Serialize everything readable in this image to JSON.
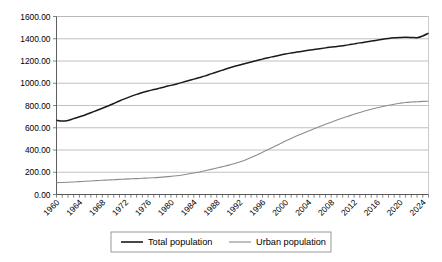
{
  "chart_data": {
    "type": "line",
    "title": "",
    "subtitle": "",
    "xlabel": "",
    "ylabel": "",
    "grid": true,
    "legend_position": "bottom",
    "ylim": [
      0,
      1600
    ],
    "ytick_step": 200,
    "ytick_labels": [
      "0.00",
      "200.00",
      "400.00",
      "600.00",
      "800.00",
      "1000.00",
      "1200.00",
      "1400.00",
      "1600.00"
    ],
    "ytick_values": [
      0,
      200,
      400,
      600,
      800,
      1000,
      1200,
      1400,
      1600
    ],
    "xlim": [
      1960,
      2025
    ],
    "xtick_step": 4,
    "xtick_labels": [
      "1960",
      "1964",
      "1968",
      "1972",
      "1976",
      "1980",
      "1984",
      "1988",
      "1992",
      "1996",
      "2000",
      "2004",
      "2008",
      "2012",
      "2016",
      "2020",
      "2024"
    ],
    "xtick_values": [
      1960,
      1964,
      1968,
      1972,
      1976,
      1980,
      1984,
      1988,
      1992,
      1996,
      2000,
      2004,
      2008,
      2012,
      2016,
      2020,
      2024
    ],
    "x": [
      1960,
      1961,
      1962,
      1963,
      1964,
      1965,
      1966,
      1967,
      1968,
      1969,
      1970,
      1971,
      1972,
      1973,
      1974,
      1975,
      1976,
      1977,
      1978,
      1979,
      1980,
      1981,
      1982,
      1983,
      1984,
      1985,
      1986,
      1987,
      1988,
      1989,
      1990,
      1991,
      1992,
      1993,
      1994,
      1995,
      1996,
      1997,
      1998,
      1999,
      2000,
      2001,
      2002,
      2003,
      2004,
      2005,
      2006,
      2007,
      2008,
      2009,
      2010,
      2011,
      2012,
      2013,
      2014,
      2015,
      2016,
      2017,
      2018,
      2019,
      2020,
      2021,
      2022,
      2023,
      2024,
      2025
    ],
    "series": [
      {
        "name": "Total population",
        "color": "#1a1a1a",
        "values": [
          667,
          660,
          666,
          682,
          699,
          715,
          735,
          755,
          775,
          796,
          818,
          841,
          862,
          882,
          900,
          916,
          931,
          943,
          956,
          969,
          981,
          994,
          1008,
          1023,
          1037,
          1051,
          1066,
          1084,
          1101,
          1118,
          1135,
          1150,
          1164,
          1178,
          1191,
          1204,
          1217,
          1230,
          1241,
          1252,
          1263,
          1272,
          1280,
          1288,
          1296,
          1304,
          1311,
          1318,
          1325,
          1331,
          1338,
          1345,
          1354,
          1363,
          1371,
          1379,
          1387,
          1396,
          1403,
          1408,
          1411,
          1413,
          1412,
          1410,
          1425,
          1450
        ]
      },
      {
        "name": "Urban population",
        "color": "#8c8c8c",
        "values": [
          107,
          108,
          110,
          113,
          116,
          119,
          122,
          125,
          128,
          130,
          133,
          136,
          138,
          141,
          143,
          146,
          148,
          151,
          154,
          158,
          163,
          169,
          176,
          184,
          193,
          203,
          214,
          226,
          238,
          250,
          262,
          276,
          292,
          311,
          332,
          355,
          380,
          405,
          430,
          455,
          480,
          504,
          527,
          549,
          570,
          591,
          611,
          631,
          650,
          669,
          687,
          704,
          721,
          737,
          752,
          766,
          779,
          791,
          802,
          812,
          820,
          827,
          831,
          834,
          837,
          838
        ]
      }
    ],
    "legend": [
      {
        "label": "Total population",
        "color": "#1a1a1a"
      },
      {
        "label": "Urban population",
        "color": "#8c8c8c"
      }
    ]
  }
}
